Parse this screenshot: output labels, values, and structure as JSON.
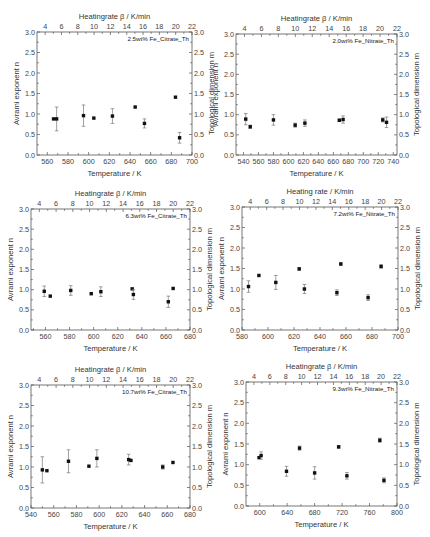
{
  "chart_data": [
    {
      "type": "scatter",
      "label": "2.5wt% Fe_Citrate_Th",
      "xlabel": "Temperature / K",
      "ylabel": "Avrami exponent n",
      "y2label": "Topological dimension m",
      "top_xlabel": "Heatingrate β / K/min",
      "xlim": [
        550,
        700
      ],
      "xticks": [
        560,
        580,
        600,
        620,
        640,
        660,
        680,
        700
      ],
      "ylim": [
        0,
        3
      ],
      "yticks": [
        "0.0",
        "0.5",
        "1.0",
        "1.5",
        "2.0",
        "2.5",
        "3.0"
      ],
      "top_xlim": [
        3,
        22
      ],
      "top_xticks": [
        4,
        6,
        8,
        10,
        12,
        14,
        16,
        18,
        20,
        22
      ],
      "points": [
        {
          "x": 566,
          "y": 0.88,
          "err": 0
        },
        {
          "x": 569,
          "y": 0.88,
          "err": 0.29
        },
        {
          "x": 595,
          "y": 0.96,
          "err": 0.26
        },
        {
          "x": 605,
          "y": 0.9,
          "err": 0
        },
        {
          "x": 623,
          "y": 0.95,
          "err": 0.18
        },
        {
          "x": 645,
          "y": 1.17,
          "err": 0
        },
        {
          "x": 654,
          "y": 0.77,
          "err": 0.11
        },
        {
          "x": 684,
          "y": 1.41,
          "err": 0
        },
        {
          "x": 688,
          "y": 0.42,
          "err": 0.13
        }
      ]
    },
    {
      "type": "scatter",
      "label": "2.0wt% Fe_Nitrate_Th",
      "xlabel": "Temperature / K",
      "ylabel": "Avrami exponent n",
      "y2label": "Topological dimension m",
      "top_xlabel": "Heatingrate β / K/min",
      "xlim": [
        530,
        745
      ],
      "xticks": [
        540,
        560,
        580,
        600,
        620,
        640,
        660,
        680,
        700,
        720,
        740
      ],
      "ylim": [
        0,
        3
      ],
      "yticks": [
        "0.0",
        "0.5",
        "1.0",
        "1.5",
        "2.0",
        "2.5",
        "3.0"
      ],
      "top_xlim": [
        3,
        22
      ],
      "top_xticks": [
        4,
        6,
        8,
        10,
        12,
        14,
        16,
        18,
        20,
        22
      ],
      "points": [
        {
          "x": 543,
          "y": 0.89,
          "err": 0.14
        },
        {
          "x": 549,
          "y": 0.7,
          "err": 0.04
        },
        {
          "x": 580,
          "y": 0.87,
          "err": 0.13
        },
        {
          "x": 609,
          "y": 0.74,
          "err": 0.05
        },
        {
          "x": 622,
          "y": 0.79,
          "err": 0.08
        },
        {
          "x": 668,
          "y": 0.86,
          "err": 0.03
        },
        {
          "x": 673,
          "y": 0.88,
          "err": 0.09
        },
        {
          "x": 726,
          "y": 0.87,
          "err": 0.05
        },
        {
          "x": 731,
          "y": 0.81,
          "err": 0.13
        }
      ]
    },
    {
      "type": "scatter",
      "label": "6.3wt% Fe_Citrate_Th",
      "xlabel": "Temperature / K",
      "ylabel": "Avrami exponent n",
      "y2label": "Topological dimension m",
      "top_xlabel": "Heatingrate β / K/min",
      "xlim": [
        548,
        680
      ],
      "xticks": [
        560,
        580,
        600,
        620,
        640,
        660,
        680
      ],
      "ylim": [
        0,
        3
      ],
      "yticks": [
        "0.0",
        "0.5",
        "1.0",
        "1.5",
        "2.0",
        "2.5",
        "3.0"
      ],
      "top_xlim": [
        3,
        22
      ],
      "top_xticks": [
        4,
        6,
        8,
        10,
        12,
        14,
        16,
        18,
        20,
        22
      ],
      "points": [
        {
          "x": 559,
          "y": 0.96,
          "err": 0.13
        },
        {
          "x": 564,
          "y": 0.84,
          "err": 0
        },
        {
          "x": 581,
          "y": 0.98,
          "err": 0.12
        },
        {
          "x": 598,
          "y": 0.9,
          "err": 0
        },
        {
          "x": 606,
          "y": 0.95,
          "err": 0.12
        },
        {
          "x": 632,
          "y": 1.02,
          "err": 0
        },
        {
          "x": 633,
          "y": 0.88,
          "err": 0.12
        },
        {
          "x": 662,
          "y": 0.7,
          "err": 0.14
        },
        {
          "x": 666,
          "y": 1.03,
          "err": 0
        }
      ]
    },
    {
      "type": "scatter",
      "label": "7.2wt% Fe_Nitrate_Th",
      "xlabel": "Temperature / K",
      "ylabel": "Avrami exponent n",
      "y2label": "Topological dimension m",
      "top_xlabel": "Heating rate / K/min",
      "xlim": [
        580,
        700
      ],
      "xticks": [
        580,
        600,
        620,
        640,
        660,
        680,
        700
      ],
      "ylim": [
        0,
        3
      ],
      "yticks": [
        "0.0",
        "0.5",
        "1.0",
        "1.5",
        "2.0",
        "2.5",
        "3.0"
      ],
      "top_xlim": [
        3,
        22
      ],
      "top_xticks": [
        4,
        6,
        8,
        10,
        12,
        14,
        16,
        18,
        20,
        22
      ],
      "points": [
        {
          "x": 585,
          "y": 1.06,
          "err": 0.14
        },
        {
          "x": 593,
          "y": 1.33,
          "err": 0
        },
        {
          "x": 606,
          "y": 1.16,
          "err": 0.17
        },
        {
          "x": 624,
          "y": 1.49,
          "err": 0.03
        },
        {
          "x": 628,
          "y": 1.0,
          "err": 0.11
        },
        {
          "x": 653,
          "y": 0.91,
          "err": 0.07
        },
        {
          "x": 656,
          "y": 1.61,
          "err": 0.03
        },
        {
          "x": 677,
          "y": 0.79,
          "err": 0.07
        },
        {
          "x": 687,
          "y": 1.55,
          "err": 0.04
        }
      ]
    },
    {
      "type": "scatter",
      "label": "10.7wt% Fe_Citrate_Th",
      "xlabel": "Temperature / K",
      "ylabel": "Avrami exponent n",
      "y2label": "Topological dimension m",
      "top_xlabel": "Heatingrate β / K/min",
      "xlim": [
        540,
        680
      ],
      "xticks": [
        540,
        560,
        580,
        600,
        620,
        640,
        660,
        680
      ],
      "ylim": [
        0,
        3
      ],
      "yticks": [
        "0.0",
        "0.5",
        "1.0",
        "1.5",
        "2.0",
        "2.5",
        "3.0"
      ],
      "top_xlim": [
        3,
        22
      ],
      "top_xticks": [
        4,
        6,
        8,
        10,
        12,
        14,
        16,
        18,
        20,
        22
      ],
      "points": [
        {
          "x": 550,
          "y": 0.93,
          "err": 0.32
        },
        {
          "x": 554,
          "y": 0.91,
          "err": 0
        },
        {
          "x": 573,
          "y": 1.14,
          "err": 0.28
        },
        {
          "x": 591,
          "y": 1.02,
          "err": 0
        },
        {
          "x": 598,
          "y": 1.21,
          "err": 0.21
        },
        {
          "x": 626,
          "y": 1.18,
          "err": 0.13
        },
        {
          "x": 628,
          "y": 1.16,
          "err": 0
        },
        {
          "x": 656,
          "y": 1.0,
          "err": 0.05
        },
        {
          "x": 665,
          "y": 1.11,
          "err": 0
        }
      ]
    },
    {
      "type": "scatter",
      "label": "9.3wt% Fe_Nitrate_Th",
      "xlabel": "Temperature / K",
      "ylabel": "Avrami exponent n",
      "y2label": "Topological dimension m",
      "top_xlabel": "Heatingrate β / K/min",
      "xlim": [
        580,
        800
      ],
      "xticks": [
        600,
        640,
        680,
        720,
        760,
        800
      ],
      "ylim": [
        0,
        3
      ],
      "yticks": [
        "0.0",
        "0.5",
        "1.0",
        "1.5",
        "2.0",
        "2.5",
        "3.0"
      ],
      "top_xlim": [
        3,
        22
      ],
      "top_xticks": [
        4,
        6,
        8,
        10,
        12,
        14,
        16,
        18,
        20,
        22
      ],
      "points": [
        {
          "x": 599,
          "y": 1.17,
          "err": 0
        },
        {
          "x": 602,
          "y": 1.22,
          "err": 0.09
        },
        {
          "x": 639,
          "y": 0.84,
          "err": 0.12
        },
        {
          "x": 658,
          "y": 1.4,
          "err": 0.05
        },
        {
          "x": 680,
          "y": 0.8,
          "err": 0.15
        },
        {
          "x": 715,
          "y": 1.43,
          "err": 0.03
        },
        {
          "x": 727,
          "y": 0.73,
          "err": 0.08
        },
        {
          "x": 775,
          "y": 1.59,
          "err": 0.05
        },
        {
          "x": 781,
          "y": 0.62,
          "err": 0.06
        }
      ]
    }
  ]
}
